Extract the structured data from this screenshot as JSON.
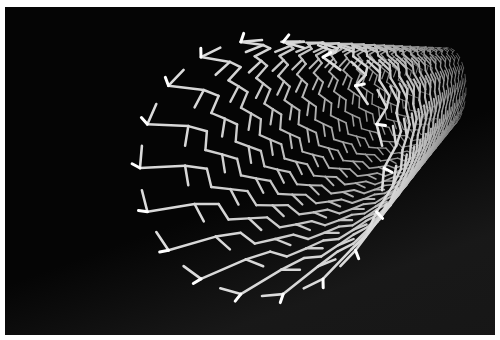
{
  "image": {
    "subject": "3D rendering of a carbon nanotube",
    "colors": {
      "border": "#ffffff",
      "background": "#050505",
      "bond": "#d9d9d9",
      "bond_highlight": "#ffffff",
      "bond_shadow": "#6e6e6e"
    },
    "tube": {
      "mouth_center": [
        262,
        168
      ],
      "mouth_rx": 122,
      "mouth_ry": 128,
      "far_center": [
        448,
        88
      ],
      "far_rx": 18,
      "far_ry": 40,
      "rings": 30,
      "atoms_per_ring": 36
    }
  }
}
